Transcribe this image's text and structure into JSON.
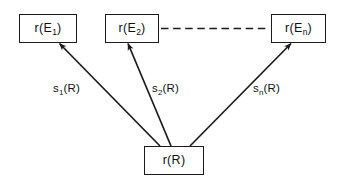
{
  "diagram": {
    "background_color": "#ffffff",
    "stroke_color": "#1b1b1b",
    "text_color": "#111111",
    "nodes": [
      {
        "id": "e1",
        "label_prefix": "r(E",
        "label_subscript": "1",
        "label_suffix": ")",
        "label_full": "r(E1)",
        "position": "top-left"
      },
      {
        "id": "e2",
        "label_prefix": "r(E",
        "label_subscript": "2",
        "label_suffix": ")",
        "label_full": "r(E2)",
        "position": "top-center"
      },
      {
        "id": "en",
        "label_prefix": "r(E",
        "label_subscript": "n",
        "label_suffix": ")",
        "label_full": "r(En)",
        "position": "top-right"
      },
      {
        "id": "r",
        "label_prefix": "r(R)",
        "label_subscript": "",
        "label_suffix": "",
        "label_full": "r(R)",
        "position": "bottom-center"
      }
    ],
    "edges": [
      {
        "id": "s1",
        "from": "r",
        "to": "e1",
        "style": "solid",
        "arrowhead": "at-target",
        "label_prefix": "s",
        "label_subscript": "1",
        "label_suffix": "(R)",
        "label_full": "s1(R)"
      },
      {
        "id": "s2",
        "from": "r",
        "to": "e2",
        "style": "solid",
        "arrowhead": "at-target",
        "label_prefix": "s",
        "label_subscript": "2",
        "label_suffix": "(R)",
        "label_full": "s2(R)"
      },
      {
        "id": "sn",
        "from": "r",
        "to": "en",
        "style": "solid",
        "arrowhead": "at-target",
        "label_prefix": "s",
        "label_subscript": "n",
        "label_suffix": "(R)",
        "label_full": "sn(R)"
      },
      {
        "id": "ellipsis",
        "from": "e2",
        "to": "en",
        "style": "dashed",
        "arrowhead": "none",
        "label_full": ""
      }
    ]
  }
}
